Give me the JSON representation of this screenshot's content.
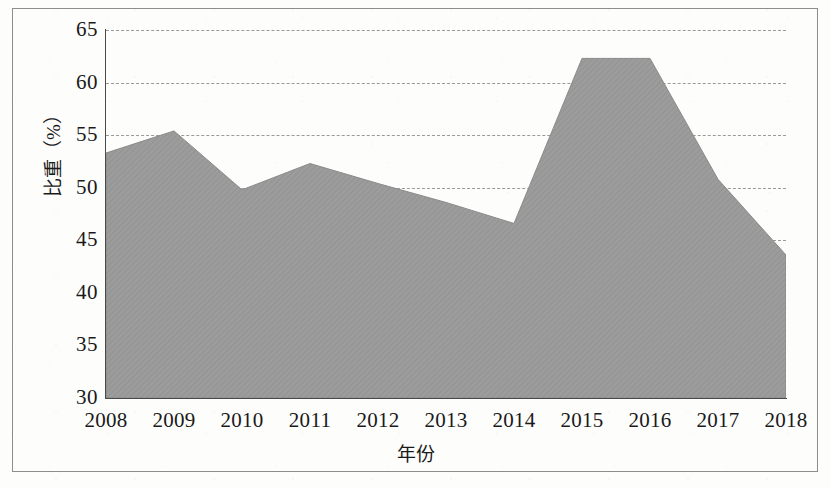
{
  "chart_data": {
    "type": "area",
    "title": "",
    "xlabel": "年份",
    "ylabel": "比重（%）",
    "categories": [
      "2008",
      "2009",
      "2010",
      "2011",
      "2012",
      "2013",
      "2014",
      "2015",
      "2016",
      "2017",
      "2018"
    ],
    "values": [
      53.3,
      55.4,
      49.8,
      52.3,
      50.4,
      48.6,
      46.6,
      62.3,
      62.3,
      50.8,
      43.6
    ],
    "series": [
      {
        "name": "比重（%）",
        "values": [
          53.3,
          55.4,
          49.8,
          52.3,
          50.4,
          48.6,
          46.6,
          62.3,
          62.3,
          50.8,
          43.6
        ]
      }
    ],
    "ylim": [
      30,
      65
    ],
    "yticks": [
      30,
      35,
      40,
      45,
      50,
      55,
      60,
      65
    ],
    "ytick_labels": [
      "30",
      "35",
      "40",
      "45",
      "50",
      "55",
      "60",
      "65"
    ],
    "gridlines": [
      35,
      40,
      45,
      50,
      55,
      60,
      65
    ],
    "grid": true,
    "legend": false,
    "legend_position": "none",
    "colors": {
      "area_fill": "#9c9c9c",
      "axis": "#4a4a4a",
      "grid": "#9a9a9a",
      "text": "#1a1a1a",
      "frame": "#8d8d8d",
      "background": "#fdfdfc"
    }
  }
}
